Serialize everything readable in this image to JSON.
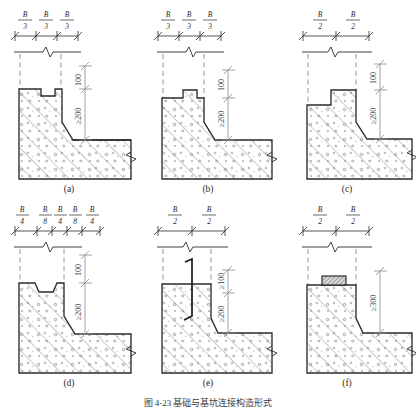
{
  "figure": {
    "title": "图 4-23  基础与基坑连接构造形式",
    "drawing_type": "engineering-section-detail",
    "line_color": "#2b2b2b",
    "hatch_color": "#555555",
    "dim_color": "#4a4a4a",
    "centerline_color": "#777777",
    "background": "#ffffff",
    "panels": [
      {
        "id": "a",
        "label": "(a)",
        "top_dims": [
          "B/3",
          "B/3",
          "B/3"
        ],
        "top_dims_fractions": [
          {
            "num": "B",
            "den": "3"
          },
          {
            "num": "B",
            "den": "3"
          },
          {
            "num": "B",
            "den": "3"
          }
        ],
        "vertical_dims": [
          "100",
          "≥200"
        ],
        "notch": "center-recess",
        "has_embed_plate": false,
        "has_dowel": false
      },
      {
        "id": "b",
        "label": "(b)",
        "top_dims": [
          "B/3",
          "B/3",
          "B/3"
        ],
        "top_dims_fractions": [
          {
            "num": "B",
            "den": "3"
          },
          {
            "num": "B",
            "den": "3"
          },
          {
            "num": "B",
            "den": "3"
          }
        ],
        "vertical_dims": [
          "100",
          "≥200"
        ],
        "notch": "center-boss",
        "has_embed_plate": false,
        "has_dowel": false
      },
      {
        "id": "c",
        "label": "(c)",
        "top_dims": [
          "B/2",
          "B/2"
        ],
        "top_dims_fractions": [
          {
            "num": "B",
            "den": "2"
          },
          {
            "num": "B",
            "den": "2"
          }
        ],
        "vertical_dims": [
          "100",
          "≥200"
        ],
        "notch": "right-step",
        "has_embed_plate": false,
        "has_dowel": false
      },
      {
        "id": "d",
        "label": "(d)",
        "top_dims": [
          "B/4",
          "B/8",
          "B/4",
          "B/8",
          "B/4"
        ],
        "top_dims_fractions": [
          {
            "num": "B",
            "den": "4"
          },
          {
            "num": "B",
            "den": "8"
          },
          {
            "num": "B",
            "den": "4"
          },
          {
            "num": "B",
            "den": "8"
          },
          {
            "num": "B",
            "den": "4"
          }
        ],
        "vertical_dims": [
          "100",
          "≥200"
        ],
        "notch": "double-trapezoid-groove",
        "has_embed_plate": false,
        "has_dowel": false
      },
      {
        "id": "e",
        "label": "(e)",
        "top_dims": [
          "B/2",
          "B/2"
        ],
        "top_dims_fractions": [
          {
            "num": "B",
            "den": "2"
          },
          {
            "num": "B",
            "den": "2"
          }
        ],
        "vertical_dims": [
          "≥200",
          "≥100"
        ],
        "notch": "flat",
        "has_embed_plate": false,
        "has_dowel": true
      },
      {
        "id": "f",
        "label": "(f)",
        "top_dims": [
          "B/2",
          "B/2"
        ],
        "top_dims_fractions": [
          {
            "num": "B",
            "den": "2"
          },
          {
            "num": "B",
            "den": "2"
          }
        ],
        "vertical_dims": [
          "≥300"
        ],
        "notch": "flat",
        "has_embed_plate": true,
        "has_dowel": false
      }
    ]
  }
}
